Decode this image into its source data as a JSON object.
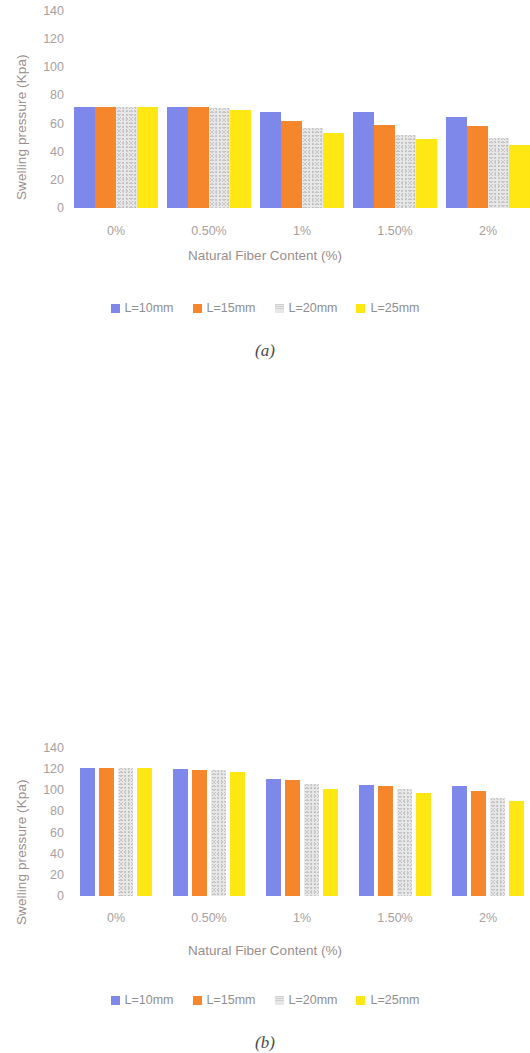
{
  "figure": {
    "panels": [
      {
        "caption": "(a)",
        "chart_data": {
          "type": "bar",
          "title": "",
          "xlabel": "Natural Fiber Content (%)",
          "ylabel": "Swelling pressure (Kpa)",
          "categories": [
            "0%",
            "0.50%",
            "1%",
            "1.50%",
            "2%"
          ],
          "yticks": [
            0,
            20,
            40,
            60,
            80,
            100,
            120,
            140
          ],
          "ylim": [
            0,
            140
          ],
          "grid": false,
          "legend_position": "bottom",
          "series": [
            {
              "name": "L=10mm",
              "color": "#7d88ea",
              "values": [
                72,
                72,
                68,
                68,
                65
              ]
            },
            {
              "name": "L=15mm",
              "color": "#f6862c",
              "values": [
                72,
                72,
                62,
                59,
                58
              ]
            },
            {
              "name": "L=20mm",
              "color": "#e7e7e7",
              "values": [
                72,
                71,
                57,
                52,
                50
              ]
            },
            {
              "name": "L=25mm",
              "color": "#ffe713",
              "values": [
                72,
                70,
                53,
                49,
                45
              ]
            }
          ]
        }
      },
      {
        "caption": "(b)",
        "chart_data": {
          "type": "bar",
          "title": "",
          "xlabel": "Natural Fiber Content (%)",
          "ylabel": "Swelling pressure (Kpa)",
          "categories": [
            "0%",
            "0.50%",
            "1%",
            "1.50%",
            "2%"
          ],
          "yticks": [
            0,
            20,
            40,
            60,
            80,
            100,
            120,
            140
          ],
          "ylim": [
            0,
            140
          ],
          "grid": false,
          "legend_position": "bottom",
          "series": [
            {
              "name": "L=10mm",
              "color": "#7d88ea",
              "values": [
                121,
                120,
                111,
                105,
                104
              ]
            },
            {
              "name": "L=15mm",
              "color": "#f6862c",
              "values": [
                121,
                119,
                110,
                104,
                99
              ]
            },
            {
              "name": "L=20mm",
              "color": "#e7e7e7",
              "values": [
                121,
                119,
                106,
                101,
                93
              ]
            },
            {
              "name": "L=25mm",
              "color": "#ffe713",
              "values": [
                121,
                117,
                101,
                97,
                90
              ]
            }
          ]
        }
      }
    ]
  }
}
